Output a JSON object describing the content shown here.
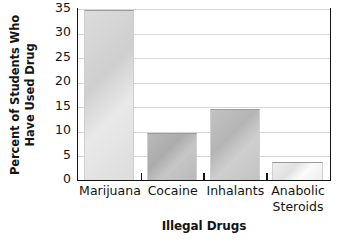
{
  "chart_data": {
    "type": "bar",
    "title": "",
    "xlabel": "Illegal Drugs",
    "ylabel_lines": [
      "Percent of Students Who",
      "Have Used Drug"
    ],
    "ylabel": "Percent of Students Who Have Used Drug",
    "categories": [
      "Marijuana",
      "Cocaine",
      "Inhalants",
      "Anabolic Steroids"
    ],
    "category_lines": [
      [
        "Marijuana"
      ],
      [
        "Cocaine"
      ],
      [
        "Inhalants"
      ],
      [
        "Anabolic",
        "Steroids"
      ]
    ],
    "values": [
      34.8,
      9.5,
      14.5,
      3.7
    ],
    "ylim": [
      0,
      35
    ],
    "yticks": [
      0,
      5,
      10,
      15,
      20,
      25,
      30,
      35
    ],
    "ytick_labels": [
      "0",
      "5",
      "10",
      "15",
      "20",
      "25",
      "30",
      "35"
    ],
    "grid": "horizontal",
    "legend": "none",
    "bar_colors": [
      "#dcdcdc",
      "#b9b9b9",
      "#c2c2c2",
      "#eeeeee"
    ],
    "axis_color": "#141414",
    "gridline_color": "#d6d6d6",
    "background": "#ffffff"
  }
}
